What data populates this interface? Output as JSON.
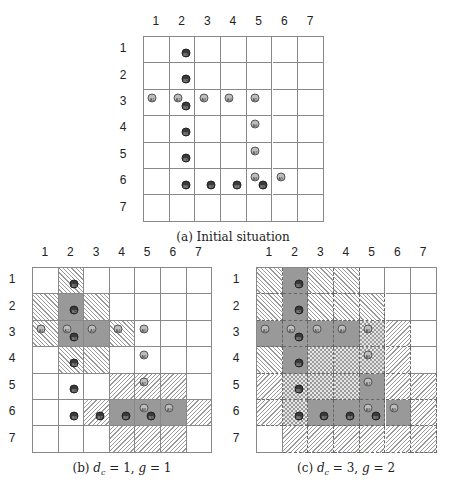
{
  "figures": [
    {
      "id": "a",
      "caption": "(a) Initial situation",
      "origin": [
        143,
        36
      ],
      "cell": [
        25.7,
        26.4
      ],
      "caption_pos": [
        233,
        230
      ],
      "col_labels": [
        "1",
        "2",
        "3",
        "4",
        "5",
        "6",
        "7"
      ],
      "row_labels": [
        "1",
        "2",
        "3",
        "4",
        "5",
        "6",
        "7"
      ],
      "cells": [
        [
          "white",
          "white",
          "white",
          "white",
          "white",
          "white",
          "white"
        ],
        [
          "white",
          "white",
          "white",
          "white",
          "white",
          "white",
          "white"
        ],
        [
          "white",
          "white",
          "white",
          "white",
          "white",
          "white",
          "white"
        ],
        [
          "white",
          "white",
          "white",
          "white",
          "white",
          "white",
          "white"
        ],
        [
          "white",
          "white",
          "white",
          "white",
          "white",
          "white",
          "white"
        ],
        [
          "white",
          "white",
          "white",
          "white",
          "white",
          "white",
          "white"
        ],
        [
          "white",
          "white",
          "white",
          "white",
          "white",
          "white",
          "white"
        ]
      ]
    },
    {
      "id": "b",
      "caption": "(b) dc = 1, g = 1",
      "origin": [
        32,
        267
      ],
      "cell": [
        25.6,
        26.4
      ],
      "caption_pos": [
        122,
        461
      ],
      "col_labels": [
        "1",
        "2",
        "3",
        "4",
        "5",
        "6",
        "7"
      ],
      "row_labels": [
        "1",
        "2",
        "3",
        "4",
        "5",
        "6",
        "7"
      ],
      "cells": [
        [
          "white",
          "fwd",
          "white",
          "white",
          "white",
          "white",
          "white"
        ],
        [
          "fwd",
          "gray",
          "fwd",
          "white",
          "white",
          "white",
          "white"
        ],
        [
          "fwd",
          "gray",
          "gray",
          "fwd",
          "white",
          "white",
          "white"
        ],
        [
          "white",
          "fwd",
          "fwd",
          "white",
          "white",
          "white",
          "white"
        ],
        [
          "white",
          "white",
          "white",
          "back",
          "back",
          "back",
          "white"
        ],
        [
          "white",
          "white",
          "back",
          "gray",
          "gray",
          "gray",
          "back"
        ],
        [
          "white",
          "white",
          "white",
          "back",
          "back",
          "back",
          "white"
        ]
      ]
    },
    {
      "id": "c",
      "caption": "(c) dc = 3, g = 2",
      "origin": [
        256,
        267
      ],
      "cell": [
        25.7,
        26.4
      ],
      "caption_pos": [
        346,
        461
      ],
      "col_labels": [
        "1",
        "2",
        "3",
        "4",
        "5",
        "6",
        "7"
      ],
      "row_labels": [
        "1",
        "2",
        "3",
        "4",
        "5",
        "6",
        "7"
      ],
      "cells": [
        [
          "fwd",
          "gray",
          "fwd",
          "fwd",
          "white",
          "white",
          "white"
        ],
        [
          "fwd",
          "gray",
          "fwd",
          "fwd",
          "fwd",
          "white",
          "white"
        ],
        [
          "gray",
          "gray",
          "gray",
          "gray",
          "check",
          "back",
          "white"
        ],
        [
          "fwd",
          "gray",
          "check",
          "check",
          "check",
          "back",
          "white"
        ],
        [
          "back",
          "check",
          "check",
          "check",
          "gray",
          "back",
          "back"
        ],
        [
          "back",
          "check",
          "gray",
          "gray",
          "gray",
          "gray",
          "back"
        ],
        [
          "white",
          "back",
          "back",
          "back",
          "back",
          "back",
          "back"
        ]
      ]
    }
  ],
  "markers": [
    {
      "label": "B1",
      "type": "B",
      "col": 2,
      "row": 1,
      "dx": 0.62,
      "dy": 0.6
    },
    {
      "label": "B2",
      "type": "B",
      "col": 2,
      "row": 2,
      "dx": 0.62,
      "dy": 0.6
    },
    {
      "label": "A1",
      "type": "A",
      "col": 1,
      "row": 3,
      "dx": 0.32,
      "dy": 0.3
    },
    {
      "label": "A2",
      "type": "A",
      "col": 2,
      "row": 3,
      "dx": 0.32,
      "dy": 0.3
    },
    {
      "label": "B3",
      "type": "B",
      "col": 2,
      "row": 3,
      "dx": 0.62,
      "dy": 0.62
    },
    {
      "label": "A3",
      "type": "A",
      "col": 3,
      "row": 3,
      "dx": 0.32,
      "dy": 0.3
    },
    {
      "label": "A4",
      "type": "A",
      "col": 4,
      "row": 3,
      "dx": 0.32,
      "dy": 0.3
    },
    {
      "label": "A5",
      "type": "A",
      "col": 5,
      "row": 3,
      "dx": 0.32,
      "dy": 0.3
    },
    {
      "label": "B4",
      "type": "B",
      "col": 2,
      "row": 4,
      "dx": 0.62,
      "dy": 0.6
    },
    {
      "label": "A6",
      "type": "A",
      "col": 5,
      "row": 4,
      "dx": 0.32,
      "dy": 0.3
    },
    {
      "label": "B5",
      "type": "B",
      "col": 2,
      "row": 5,
      "dx": 0.62,
      "dy": 0.6
    },
    {
      "label": "A7",
      "type": "A",
      "col": 5,
      "row": 5,
      "dx": 0.32,
      "dy": 0.3
    },
    {
      "label": "B6",
      "type": "B",
      "col": 2,
      "row": 6,
      "dx": 0.62,
      "dy": 0.6
    },
    {
      "label": "B7",
      "type": "B",
      "col": 3,
      "row": 6,
      "dx": 0.62,
      "dy": 0.6
    },
    {
      "label": "B8",
      "type": "B",
      "col": 4,
      "row": 6,
      "dx": 0.62,
      "dy": 0.6
    },
    {
      "label": "A8",
      "type": "A",
      "col": 5,
      "row": 6,
      "dx": 0.32,
      "dy": 0.3
    },
    {
      "label": "B9",
      "type": "B",
      "col": 5,
      "row": 6,
      "dx": 0.62,
      "dy": 0.6
    },
    {
      "label": "A9",
      "type": "A",
      "col": 6,
      "row": 6,
      "dx": 0.32,
      "dy": 0.3
    }
  ],
  "legend_note": "gray = cell in path; forward hatch / backward hatch / checkered = neighborhood zones"
}
